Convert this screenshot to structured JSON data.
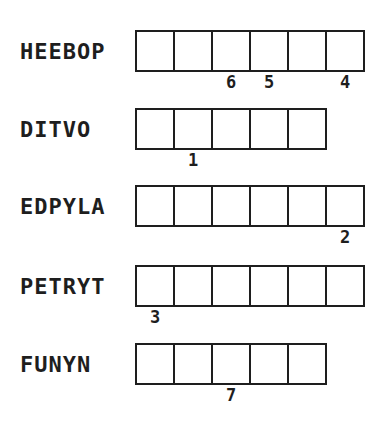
{
  "puzzle": {
    "type": "word-scramble",
    "colors": {
      "ink": "#1e1e1e",
      "background": "#ffffff"
    },
    "rows": [
      {
        "scrambled": "HEEBOP",
        "cells": 6,
        "numbers": [
          {
            "cell": 3,
            "label": "6"
          },
          {
            "cell": 4,
            "label": "5"
          },
          {
            "cell": 6,
            "label": "4"
          }
        ]
      },
      {
        "scrambled": "DITVO",
        "cells": 5,
        "numbers": [
          {
            "cell": 2,
            "label": "1"
          }
        ]
      },
      {
        "scrambled": "EDPYLA",
        "cells": 6,
        "numbers": [
          {
            "cell": 6,
            "label": "2"
          }
        ]
      },
      {
        "scrambled": "PETRYT",
        "cells": 6,
        "numbers": [
          {
            "cell": 1,
            "label": "3"
          }
        ]
      },
      {
        "scrambled": "FUNYN",
        "cells": 5,
        "numbers": [
          {
            "cell": 3,
            "label": "7"
          }
        ]
      }
    ]
  }
}
